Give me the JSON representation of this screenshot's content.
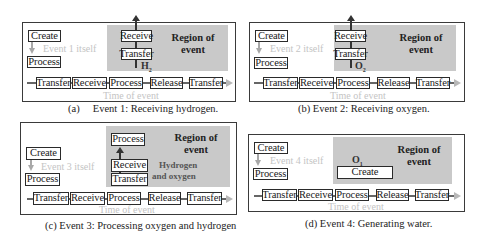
{
  "panels": [
    {
      "id": "a",
      "event_itself": "Event 1 itself",
      "create": "Create",
      "process": "Process",
      "region_label": "Region of event",
      "region_label_line1": "Region of",
      "region_label_line2": "event",
      "stack": [
        "Receive",
        "Transfer"
      ],
      "molecule": "H",
      "molecule_sub": "2",
      "timeline": [
        "Transfer",
        "Receive",
        "Process",
        "Release",
        "Transfer"
      ],
      "time_label": "Time of event",
      "caption": "(a)     Event 1: Receiving hydrogen."
    },
    {
      "id": "b",
      "event_itself": "Event 2 itself",
      "create": "Create",
      "process": "Process",
      "region_label_line1": "Region of",
      "region_label_line2": "event",
      "stack": [
        "Receive",
        "Transfer"
      ],
      "molecule": "O",
      "molecule_sub": "2",
      "timeline": [
        "Transfer",
        "Receive",
        "Process",
        "Release",
        "Transfer"
      ],
      "time_label": "Time of event",
      "caption": "(b) Event 2: Receiving oxygen."
    },
    {
      "id": "c",
      "event_itself": "Event 3 itself",
      "create": "Create",
      "process": "Process",
      "region_label_line1": "Region of",
      "region_label_line2": "event",
      "stack": [
        "Process",
        "Receive",
        "Transfer"
      ],
      "gas_line1": "Hydrogen",
      "gas_line2": "and oxygen",
      "timeline": [
        "Transfer",
        "Receive",
        "Process",
        "Release",
        "Transfer"
      ],
      "time_label": "Time of event",
      "caption": "(c) Event 3: Processing oxygen and hydrogen"
    },
    {
      "id": "d",
      "event_itself": "Event 4 itself",
      "create": "Create",
      "process": "Process",
      "region_label_line1": "Region of",
      "region_label_line2": "event",
      "region_create": "Create",
      "molecule": "O",
      "molecule_sub": "1",
      "timeline": [
        "Transfer",
        "Receive",
        "Process",
        "Release",
        "Transfer"
      ],
      "time_label": "Time of event",
      "caption": "(d) Event 4: Generating water."
    }
  ],
  "colors": {
    "region_gray": "#c9c9c9",
    "ghost_text": "#c4c4c4",
    "border": "#3a3a3a"
  }
}
